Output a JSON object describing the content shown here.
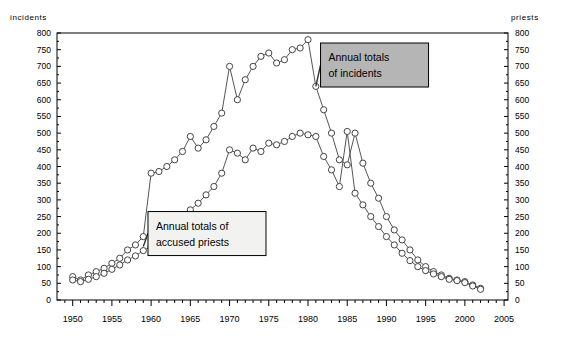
{
  "chart_data": {
    "type": "line",
    "title": "",
    "xlabel": "",
    "ylabel": "incidents",
    "ylabel_right": "priests",
    "xlim": [
      1948,
      2005.5
    ],
    "ylim": [
      0,
      800
    ],
    "ytick_step": 50,
    "xtick_step": 5,
    "x_minor_tick_step": 1,
    "grid": false,
    "legend_position": "annotations-inside-plot",
    "marker": "circle-open",
    "line_color": "#555555",
    "marker_color": "#444444",
    "frame_color": "#000000",
    "x": [
      1950,
      1951,
      1952,
      1953,
      1954,
      1955,
      1956,
      1957,
      1958,
      1959,
      1960,
      1961,
      1962,
      1963,
      1964,
      1965,
      1966,
      1967,
      1968,
      1969,
      1970,
      1971,
      1972,
      1973,
      1974,
      1975,
      1976,
      1977,
      1978,
      1979,
      1980,
      1981,
      1982,
      1983,
      1984,
      1985,
      1986,
      1987,
      1988,
      1989,
      1990,
      1991,
      1992,
      1993,
      1994,
      1995,
      1996,
      1997,
      1998,
      1999,
      2000,
      2001,
      2002
    ],
    "series": [
      {
        "name": "Annual totals of incidents",
        "label": "incidents",
        "axis": "left",
        "values": [
          70,
          60,
          75,
          85,
          95,
          110,
          125,
          150,
          165,
          190,
          380,
          385,
          400,
          420,
          445,
          490,
          455,
          480,
          520,
          560,
          700,
          600,
          660,
          700,
          730,
          740,
          710,
          720,
          750,
          755,
          780,
          640,
          570,
          500,
          420,
          405,
          500,
          410,
          350,
          305,
          250,
          210,
          180,
          150,
          120,
          100,
          85,
          75,
          65,
          60,
          55,
          45,
          35
        ]
      },
      {
        "name": "Annual totals of accused priests",
        "label": "priests",
        "axis": "right",
        "values": [
          60,
          55,
          62,
          70,
          80,
          92,
          105,
          120,
          132,
          148,
          160,
          205,
          200,
          225,
          250,
          270,
          290,
          315,
          340,
          380,
          450,
          440,
          420,
          455,
          445,
          470,
          465,
          475,
          490,
          500,
          495,
          490,
          430,
          390,
          340,
          505,
          320,
          285,
          250,
          220,
          190,
          165,
          140,
          118,
          100,
          88,
          78,
          70,
          62,
          58,
          52,
          42,
          32
        ]
      }
    ],
    "ytick_labels": [
      "0",
      "50",
      "100",
      "150",
      "200",
      "250",
      "300",
      "350",
      "400",
      "450",
      "500",
      "550",
      "600",
      "650",
      "700",
      "750",
      "800"
    ],
    "xtick_labels": [
      "1950",
      "1955",
      "1960",
      "1965",
      "1970",
      "1975",
      "1980",
      "1985",
      "1990",
      "1995",
      "2000",
      "2005"
    ],
    "annotations": [
      {
        "id": "incidents-callout",
        "text_lines": [
          "Annual totals",
          "of incidents"
        ],
        "fill": "#b5b5b5",
        "border": "#000000",
        "leader_from_x": 1981.0,
        "leader_from_y": 640,
        "box_x": 1981.6,
        "box_y": 770
      },
      {
        "id": "priests-callout",
        "text_lines": [
          "Annual totals of",
          "accused priests"
        ],
        "fill": "#f2f2f0",
        "border": "#000000",
        "leader_from_x": 1959.0,
        "leader_from_y": 160,
        "box_x": 1959.6,
        "box_y": 265
      }
    ]
  },
  "labels": {
    "left_axis_title": "incidents",
    "right_axis_title": "priests",
    "callout_incidents_line1": "Annual totals",
    "callout_incidents_line2": "of incidents",
    "callout_priests_line1": "Annual totals of",
    "callout_priests_line2": "accused priests"
  }
}
